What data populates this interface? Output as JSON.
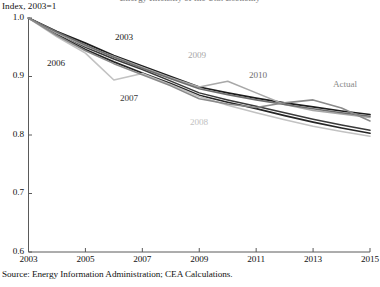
{
  "figure": {
    "clipped_title": "Energy Intensity of the U.S. Economy",
    "axis_unit_caption": "Index, 2003=1",
    "source_note": "Source: Energy Information Administration; CEA Calculations."
  },
  "chart_data": {
    "type": "line",
    "title": "Energy Intensity of the U.S. Economy",
    "subtitle": "",
    "xlabel": "",
    "ylabel": "Index, 2003=1",
    "xlim": [
      2003,
      2015
    ],
    "ylim": [
      0.6,
      1.0
    ],
    "grid": false,
    "legend": "inline-labels",
    "xticks": [
      "2003",
      "2005",
      "2007",
      "2009",
      "2011",
      "2013",
      "2015"
    ],
    "xtick_values": [
      2003,
      2005,
      2007,
      2009,
      2011,
      2013,
      2015
    ],
    "yticks": [
      "0.6",
      "0.7",
      "0.8",
      "0.9",
      "1.0"
    ],
    "ytick_values": [
      0.6,
      0.7,
      0.8,
      0.9,
      1.0
    ],
    "x": [
      2003,
      2004,
      2005,
      2006,
      2007,
      2008,
      2009,
      2010,
      2011,
      2012,
      2013,
      2014,
      2015
    ],
    "series": [
      {
        "name": "2003",
        "label": "2003",
        "color": "#1c1c1c",
        "width": 1.7,
        "label_x": 115,
        "label_y": 32,
        "values": [
          1.0,
          0.977,
          0.957,
          0.936,
          0.918,
          0.9,
          0.882,
          0.872,
          0.863,
          0.855,
          0.848,
          0.841,
          0.835
        ]
      },
      {
        "name": "2006",
        "label": "2006",
        "color": "#262626",
        "width": 1.7,
        "label_x": 47,
        "label_y": 58,
        "values": [
          1.0,
          0.972,
          0.946,
          0.925,
          0.906,
          0.888,
          0.868,
          0.856,
          0.845,
          0.833,
          0.822,
          0.812,
          0.803
        ]
      },
      {
        "name": "2007",
        "label": "2007",
        "color": "#3a3a3a",
        "width": 1.5,
        "label_x": 120,
        "label_y": 93,
        "values": [
          1.0,
          0.975,
          0.95,
          0.93,
          0.912,
          0.892,
          0.872,
          0.86,
          0.849,
          0.838,
          0.827,
          0.817,
          0.808
        ]
      },
      {
        "name": "2008",
        "label": "2008",
        "color": "#c2c2c2",
        "width": 1.6,
        "label_x": 190,
        "label_y": 117,
        "values": [
          1.0,
          0.968,
          0.94,
          0.894,
          0.905,
          0.886,
          0.866,
          0.851,
          0.838,
          0.826,
          0.815,
          0.806,
          0.798
        ]
      },
      {
        "name": "2009",
        "label": "2009",
        "color": "#a8a8a8",
        "width": 1.6,
        "label_x": 188,
        "label_y": 50,
        "values": [
          1.0,
          0.974,
          0.952,
          0.934,
          0.916,
          0.898,
          0.882,
          0.892,
          0.872,
          0.852,
          0.842,
          0.836,
          0.83
        ]
      },
      {
        "name": "2010",
        "label": "2010",
        "color": "#6e6e6e",
        "width": 1.6,
        "label_x": 249,
        "label_y": 70,
        "values": [
          1.0,
          0.976,
          0.954,
          0.933,
          0.914,
          0.896,
          0.879,
          0.869,
          0.86,
          0.852,
          0.845,
          0.838,
          0.832
        ]
      },
      {
        "name": "Actual",
        "label": "Actual",
        "color": "#8a8a8a",
        "width": 1.6,
        "label_x": 333,
        "label_y": 79,
        "values": [
          1.0,
          0.97,
          0.944,
          0.922,
          0.903,
          0.884,
          0.862,
          0.853,
          0.847,
          0.855,
          0.86,
          0.846,
          0.824
        ]
      }
    ]
  }
}
